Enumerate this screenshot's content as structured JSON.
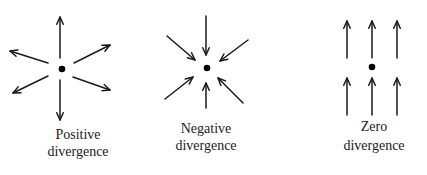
{
  "diagram": {
    "panels": [
      {
        "id": "positive",
        "label_line1": "Positive",
        "label_line2": "divergence",
        "center": [
          62,
          69
        ],
        "arrows": [
          {
            "from": [
              60,
              58
            ],
            "to": [
              60,
              17
            ]
          },
          {
            "from": [
              60,
              80
            ],
            "to": [
              60,
              120
            ]
          },
          {
            "from": [
              48,
              63
            ],
            "to": [
              10,
              51
            ]
          },
          {
            "from": [
              74,
              63
            ],
            "to": [
              110,
              45
            ]
          },
          {
            "from": [
              48,
              76
            ],
            "to": [
              13,
              93
            ]
          },
          {
            "from": [
              73,
              77
            ],
            "to": [
              110,
              90
            ]
          }
        ]
      },
      {
        "id": "negative",
        "label_line1": "Negative",
        "label_line2": "divergence",
        "center": [
          207,
          68
        ],
        "arrows": [
          {
            "from": [
              206,
              16
            ],
            "to": [
              206,
              55
            ]
          },
          {
            "from": [
              167,
              36
            ],
            "to": [
              195,
              60
            ]
          },
          {
            "from": [
              248,
              40
            ],
            "to": [
              220,
              61
            ]
          },
          {
            "from": [
              165,
              99
            ],
            "to": [
              193,
              77
            ]
          },
          {
            "from": [
              243,
              103
            ],
            "to": [
              218,
              78
            ]
          },
          {
            "from": [
              206,
              108
            ],
            "to": [
              206,
              83
            ]
          }
        ]
      },
      {
        "id": "zero",
        "label_line1": "Zero",
        "label_line2": "divergence",
        "center": [
          372,
          67
        ],
        "arrows": [
          {
            "from": [
              347,
              58
            ],
            "to": [
              347,
              21
            ]
          },
          {
            "from": [
              372,
              58
            ],
            "to": [
              372,
              21
            ]
          },
          {
            "from": [
              397,
              58
            ],
            "to": [
              397,
              21
            ]
          },
          {
            "from": [
              347,
              115
            ],
            "to": [
              347,
              78
            ]
          },
          {
            "from": [
              372,
              115
            ],
            "to": [
              372,
              78
            ]
          },
          {
            "from": [
              397,
              115
            ],
            "to": [
              397,
              78
            ]
          }
        ]
      }
    ]
  }
}
